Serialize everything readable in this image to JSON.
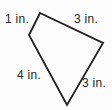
{
  "diagram": {
    "type": "quadrilateral",
    "background_color": "#fcfcfc",
    "stroke_color": "#1f1f1f",
    "text_color": "#262626",
    "stroke_width": 1.8,
    "vertices": [
      {
        "name": "top",
        "x": 40,
        "y": 13
      },
      {
        "name": "right",
        "x": 103,
        "y": 43
      },
      {
        "name": "bottom",
        "x": 67,
        "y": 105
      },
      {
        "name": "left",
        "x": 29,
        "y": 35
      }
    ],
    "labels": [
      {
        "side": "top-left",
        "text": "1 in.",
        "x": 17,
        "y": 23
      },
      {
        "side": "top-right",
        "text": "3 in.",
        "x": 86,
        "y": 23
      },
      {
        "side": "bottom-left",
        "text": "4 in.",
        "x": 29,
        "y": 79
      },
      {
        "side": "bottom-right",
        "text": "3 in.",
        "x": 94,
        "y": 87
      }
    ],
    "side_lengths_shown": [
      "1 in.",
      "3 in.",
      "4 in.",
      "3 in."
    ]
  }
}
